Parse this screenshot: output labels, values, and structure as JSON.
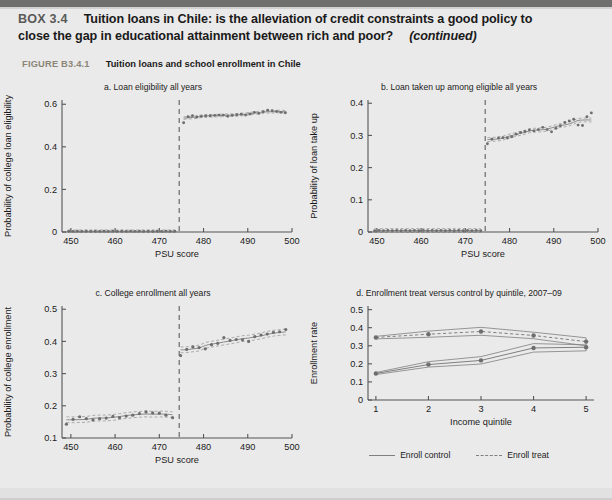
{
  "box": {
    "label": "BOX 3.4",
    "title_line1": "Tuition loans in Chile: is the alleviation of credit constraints a good policy to",
    "title_line2": "close the gap in educational attainment between rich and poor?",
    "continued": "(continued)"
  },
  "figure": {
    "number": "FIGURE B3.4.1",
    "title": "Tuition loans and school enrollment in Chile"
  },
  "colors": {
    "page_background": "#ebeaea",
    "top_rule": "#6f6f6e",
    "figure_number": "#8a8577",
    "ink": "#1a1a1a",
    "plot_line": "#7f7f7f",
    "marker": "#6e6e6e",
    "axis": "#555555",
    "cutoff_line": "#6a6a6a"
  },
  "chart_data": [
    {
      "id": "panel-a",
      "type": "scatter",
      "title": "a.  Loan eligibility all years",
      "xlabel": "PSU score",
      "ylabel": "Probability of college loan eligibility",
      "xlim": [
        448,
        500
      ],
      "ylim": [
        0,
        0.62
      ],
      "xticks": [
        450,
        460,
        470,
        480,
        490,
        500
      ],
      "yticks": [
        0,
        0.2,
        0.4,
        0.6
      ],
      "ytick_labels": [
        "0",
        "0.2",
        "0.4",
        "0.6"
      ],
      "grid": false,
      "legend": "none",
      "cutoff_x": 474.5,
      "cutoff_style": "dashed vertical line",
      "series": [
        {
          "name": "Left of cutoff (not eligible)",
          "x": [
            449.5,
            450.5,
            451.5,
            452.5,
            453.5,
            454.5,
            455.5,
            456.5,
            457.5,
            458.5,
            459.5,
            460.5,
            461.5,
            462.5,
            463.5,
            464.5,
            465.5,
            466.5,
            467.5,
            468.5,
            469.5,
            470.5,
            471.5,
            472.5,
            473.5
          ],
          "y": [
            0.004,
            0.003,
            0.004,
            0.003,
            0.004,
            0.003,
            0.004,
            0.003,
            0.004,
            0.003,
            0.004,
            0.003,
            0.004,
            0.003,
            0.004,
            0.003,
            0.004,
            0.003,
            0.004,
            0.003,
            0.004,
            0.003,
            0.004,
            0.003,
            0.004
          ]
        },
        {
          "name": "Right of cutoff (eligible)",
          "x": [
            475.5,
            476.5,
            477.5,
            478.5,
            479.5,
            480.5,
            481.5,
            482.5,
            483.5,
            484.5,
            485.5,
            486.5,
            487.5,
            488.5,
            489.5,
            490.5,
            491.5,
            492.5,
            493.5,
            494.5,
            495.5,
            496.5,
            497.5,
            498.5
          ],
          "y": [
            0.513,
            0.541,
            0.546,
            0.54,
            0.543,
            0.545,
            0.546,
            0.548,
            0.549,
            0.549,
            0.544,
            0.548,
            0.551,
            0.553,
            0.549,
            0.554,
            0.562,
            0.557,
            0.565,
            0.572,
            0.57,
            0.566,
            0.562,
            0.56
          ]
        }
      ]
    },
    {
      "id": "panel-b",
      "type": "scatter",
      "title": "b.  Loan taken up among eligible all years",
      "xlabel": "PSU score",
      "ylabel": "Probability of loan take up",
      "xlim": [
        448,
        500
      ],
      "ylim": [
        0,
        0.41
      ],
      "xticks": [
        450,
        460,
        470,
        480,
        490,
        500
      ],
      "yticks": [
        0,
        0.1,
        0.2,
        0.3,
        0.4
      ],
      "ytick_labels": [
        "0",
        "0.1",
        "0.2",
        "0.3",
        "0.4"
      ],
      "grid": false,
      "legend": "none",
      "cutoff_x": 474.5,
      "cutoff_style": "dashed vertical line",
      "series": [
        {
          "name": "Left of cutoff",
          "x": [
            449.5,
            450.5,
            451.5,
            452.5,
            453.5,
            454.5,
            455.5,
            456.5,
            457.5,
            458.5,
            459.5,
            460.5,
            461.5,
            462.5,
            463.5,
            464.5,
            465.5,
            466.5,
            467.5,
            468.5,
            469.5,
            470.5,
            471.5,
            472.5,
            473.5
          ],
          "y": [
            0.004,
            0.005,
            0.004,
            0.005,
            0.004,
            0.005,
            0.004,
            0.005,
            0.004,
            0.005,
            0.004,
            0.005,
            0.004,
            0.005,
            0.004,
            0.005,
            0.004,
            0.005,
            0.004,
            0.005,
            0.004,
            0.005,
            0.004,
            0.005,
            0.004
          ]
        },
        {
          "name": "Right of cutoff",
          "x": [
            475.0,
            476.0,
            477.5,
            478.5,
            479.5,
            480.5,
            481.5,
            482.5,
            483.5,
            484.5,
            485.5,
            486.5,
            487.5,
            488.5,
            489.5,
            490.5,
            491.5,
            492.5,
            493.5,
            494.5,
            495.5,
            496.5,
            497.5,
            498.5
          ],
          "y": [
            0.274,
            0.288,
            0.292,
            0.293,
            0.292,
            0.296,
            0.304,
            0.309,
            0.312,
            0.317,
            0.314,
            0.318,
            0.325,
            0.318,
            0.311,
            0.322,
            0.33,
            0.34,
            0.345,
            0.35,
            0.332,
            0.331,
            0.358,
            0.37
          ]
        }
      ]
    },
    {
      "id": "panel-c",
      "type": "scatter",
      "title": "c.  College enrollment all years",
      "xlabel": "PSU score",
      "ylabel": "Probability of college enrollment",
      "xlim": [
        448,
        500
      ],
      "ylim": [
        0.1,
        0.51
      ],
      "xticks": [
        450,
        460,
        470,
        480,
        490,
        500
      ],
      "yticks": [
        0.1,
        0.2,
        0.3,
        0.4,
        0.5
      ],
      "ytick_labels": [
        "0.1",
        "0.2",
        "0.3",
        "0.4",
        "0.5"
      ],
      "grid": false,
      "legend": "none",
      "cutoff_x": 474.5,
      "cutoff_style": "dashed vertical line",
      "series": [
        {
          "name": "Left of cutoff",
          "x": [
            449.0,
            450.5,
            452.0,
            453.5,
            455.0,
            456.5,
            458.0,
            459.5,
            461.0,
            462.5,
            464.0,
            465.5,
            467.0,
            468.5,
            470.0,
            471.5,
            473.0
          ],
          "y": [
            0.143,
            0.158,
            0.166,
            0.16,
            0.156,
            0.16,
            0.162,
            0.167,
            0.163,
            0.168,
            0.171,
            0.176,
            0.181,
            0.178,
            0.177,
            0.171,
            0.163
          ]
        },
        {
          "name": "Right of cutoff",
          "x": [
            474.8,
            476.2,
            477.6,
            479.0,
            480.4,
            481.8,
            483.2,
            484.6,
            486.0,
            487.4,
            488.8,
            490.2,
            491.6,
            493.0,
            494.4,
            495.8,
            497.2,
            498.6
          ],
          "y": [
            0.356,
            0.375,
            0.383,
            0.381,
            0.377,
            0.39,
            0.394,
            0.412,
            0.403,
            0.406,
            0.405,
            0.4,
            0.415,
            0.42,
            0.423,
            0.428,
            0.43,
            0.437
          ]
        }
      ]
    },
    {
      "id": "panel-d",
      "type": "line",
      "title": "d.  Enrollment treat versus control by quintile, 2007–09",
      "xlabel": "Income quintile",
      "ylabel": "Enrollment rate",
      "xlim": [
        0.85,
        5.15
      ],
      "ylim": [
        0,
        0.52
      ],
      "xticks": [
        1,
        2,
        3,
        4,
        5
      ],
      "yticks": [
        0,
        0.1,
        0.2,
        0.3,
        0.4,
        0.5
      ],
      "ytick_labels": [
        "0",
        "0.1",
        "0.2",
        "0.3",
        "0.4",
        "0.5"
      ],
      "grid": false,
      "legend": "bottom",
      "categories": [
        1,
        2,
        3,
        4,
        5
      ],
      "series": [
        {
          "name": "Enroll control",
          "style": "solid",
          "values": [
            0.147,
            0.196,
            0.219,
            0.288,
            0.292
          ],
          "ci_upper": [
            0.152,
            0.212,
            0.24,
            0.312,
            0.305
          ],
          "ci_lower": [
            0.141,
            0.182,
            0.199,
            0.265,
            0.272
          ]
        },
        {
          "name": "Enroll treat",
          "style": "dashed",
          "values": [
            0.346,
            0.364,
            0.379,
            0.357,
            0.323
          ],
          "ci_upper": [
            0.352,
            0.381,
            0.402,
            0.375,
            0.344
          ],
          "ci_lower": [
            0.338,
            0.347,
            0.358,
            0.339,
            0.3
          ]
        }
      ]
    }
  ]
}
